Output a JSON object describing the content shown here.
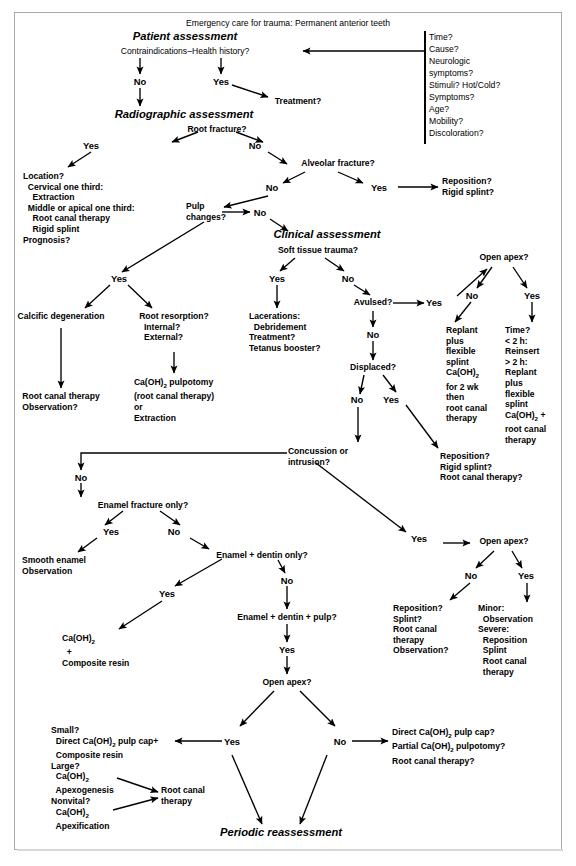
{
  "diagram": {
    "title": "Emergency care for trauma: Permanent anterior teeth",
    "terminal": "Periodic reassessment",
    "section_headers": [
      "Patient assessment",
      "Radiographic assessment",
      "Clinical assessment"
    ],
    "history_panel": {
      "items": [
        "Time?",
        "Cause?",
        "Neurologic",
        "symptoms?",
        "Stimuli? Hot/Cold?",
        "Symptoms?",
        "Age?",
        "Mobility?",
        "Discoloration?"
      ]
    },
    "decisions": {
      "contraindications": "Contraindications–Health history?",
      "root_fracture": "Root fracture?",
      "alveolar_fracture": "Alveolar fracture?",
      "pulp_changes": "Pulp\nchanges?",
      "soft_tissue": "Soft tissue trauma?",
      "avulsed": "Avulsed?",
      "displaced": "Displaced?",
      "concussion": "Concussion or\nintrusion?",
      "open_apex_avulsed": "Open apex?",
      "open_apex_concussion": "Open apex?",
      "open_apex_pulp": "Open apex?",
      "enamel_fracture": "Enamel fracture only?",
      "enamel_dentin": "Enamel + dentin only?",
      "enamel_dentin_pulp": "Enamel + dentin + pulp?"
    },
    "branch_labels": {
      "no": "No",
      "yes": "Yes"
    },
    "outcomes": {
      "treatment": "Treatment?",
      "root_fracture_yes": "Location?\n  Cervical one third:\n    Extraction\n  Middle or apical one third:\n    Root canal therapy\n    Rigid splint\nPrognosis?",
      "reposition_rigid": "Reposition?\nRigid splint?",
      "calcific": "Calcific degeneration",
      "calcific_tx": "Root canal therapy\nObservation?",
      "root_resorption": "Root resorption?\n  Internal?\n  External?",
      "lacerations": "Lacerations:\n  Debridement\nTreatment?\nTetanus booster?",
      "replant_closed": "Replant\nplus\nflexible\nsplint\nCa(OH)2\nfor 2 wk\nthen\nroot canal\ntherapy",
      "replant_open": "Time?\n< 2 h:\nReinsert\n> 2 h:\nReplant\nplus\nflexible\nsplint\nCa(OH)2 +\nroot canal\ntherapy",
      "displaced_yes": "Reposition?\nRigid splint?\nRoot canal therapy?",
      "smooth_enamel": "Smooth enamel\nObservation",
      "composite": "Ca(OH)2\n+\nComposite resin",
      "concussion_no_apex": "Reposition?\nSplint?\nRoot canal\ntherapy\nObservation?",
      "concussion_open_apex": "Minor:\n  Observation\nSevere:\n  Reposition\n  Splint\n  Root canal\n  therapy",
      "open_apex_yes": "Small?\n  Direct Ca(OH)2 pulp cap+\n  Composite resin\nLarge?\n  Ca(OH)2\n  Apexogenesis\nNonvital?\n  Ca(OH)2\n  Apexification",
      "root_canal_therapy": "Root canal\ntherapy",
      "open_apex_no": "Direct Ca(OH)2 pulp cap?\nPartial Ca(OH)2 pulpotomy?\nRoot canal therapy?"
    }
  }
}
